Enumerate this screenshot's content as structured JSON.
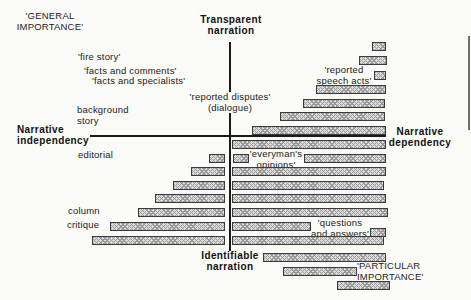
{
  "axes": {
    "top": {
      "line1": "Transparent",
      "line2": "narration"
    },
    "bottom": {
      "line1": "Identifiable",
      "line2": "narration"
    },
    "left": {
      "line1": "Narrative",
      "line2": "independency"
    },
    "right": {
      "line1": "Narrative",
      "line2": "dependency"
    }
  },
  "corners": {
    "general": {
      "line1": "'GENERAL",
      "line2": "IMPORTANCE'"
    },
    "particular": {
      "line1": "'PARTICULAR",
      "line2": "IMPORTANCE'"
    }
  },
  "labels": {
    "fire_story": "'fire story'",
    "facts_and_comments": "'facts and comments'",
    "facts_and_specialists": "'facts and specialists'",
    "reported_disputes": {
      "line1": "'reported disputes'",
      "line2": "(dialogue)"
    },
    "background_story": {
      "line1": "background",
      "line2": "story"
    },
    "editorial": "editorial",
    "column": "column",
    "critique": "critique",
    "reported_speech_acts": {
      "line1": "'reported",
      "line2": "speech acts'"
    },
    "everymans_opinions": {
      "line1": "'everyman's",
      "line2": "opinions'"
    },
    "questions_and_answers": {
      "line1": "'questions",
      "line2": "and answers'"
    }
  },
  "bars": [
    {
      "x": 372,
      "y": 42,
      "w": 14
    },
    {
      "x": 359,
      "y": 56,
      "w": 28
    },
    {
      "x": 374,
      "y": 71,
      "w": 12
    },
    {
      "x": 316,
      "y": 85,
      "w": 70
    },
    {
      "x": 303,
      "y": 99,
      "w": 82
    },
    {
      "x": 280,
      "y": 112,
      "w": 105
    },
    {
      "x": 252,
      "y": 126,
      "w": 134
    },
    {
      "x": 232,
      "y": 140,
      "w": 154
    },
    {
      "x": 209,
      "y": 154,
      "w": 16
    },
    {
      "x": 233,
      "y": 154,
      "w": 16
    },
    {
      "x": 304,
      "y": 154,
      "w": 82
    },
    {
      "x": 191,
      "y": 167,
      "w": 34
    },
    {
      "x": 232,
      "y": 167,
      "w": 154
    },
    {
      "x": 173,
      "y": 181,
      "w": 52
    },
    {
      "x": 232,
      "y": 181,
      "w": 152
    },
    {
      "x": 155,
      "y": 194,
      "w": 70
    },
    {
      "x": 232,
      "y": 194,
      "w": 154
    },
    {
      "x": 138,
      "y": 208,
      "w": 87
    },
    {
      "x": 232,
      "y": 208,
      "w": 156
    },
    {
      "x": 110,
      "y": 222,
      "w": 115
    },
    {
      "x": 232,
      "y": 222,
      "w": 79
    },
    {
      "x": 370,
      "y": 228,
      "w": 16
    },
    {
      "x": 92,
      "y": 236,
      "w": 133
    },
    {
      "x": 232,
      "y": 236,
      "w": 152
    },
    {
      "x": 263,
      "y": 253,
      "w": 123
    },
    {
      "x": 283,
      "y": 267,
      "w": 74
    },
    {
      "x": 337,
      "y": 281,
      "w": 53
    }
  ],
  "colors": {
    "bg": "#fafaf7",
    "text": "#222222",
    "line": "#1a1a1a",
    "bar_fill": "#dcdcdc",
    "bar_border": "#3c3c3c",
    "hatch": "#9a9a9a"
  }
}
